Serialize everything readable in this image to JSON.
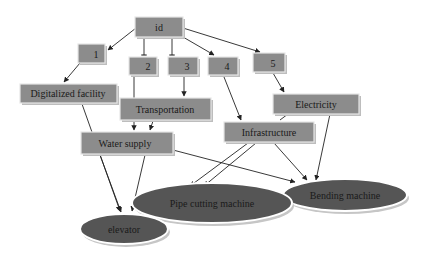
{
  "diagram": {
    "type": "directed-graph",
    "background": "#ffffff",
    "colors": {
      "rect_fill": "#8c8c8c",
      "ellipse_fill": "#555555",
      "edge": "#222222",
      "text": "#1a1a1a"
    },
    "nodes": [
      {
        "id": "id",
        "label": "id",
        "shape": "rect"
      },
      {
        "id": "n1",
        "label": "1",
        "shape": "rect"
      },
      {
        "id": "n2",
        "label": "2",
        "shape": "rect"
      },
      {
        "id": "n3",
        "label": "3",
        "shape": "rect"
      },
      {
        "id": "n4",
        "label": "4",
        "shape": "rect"
      },
      {
        "id": "n5",
        "label": "5",
        "shape": "rect"
      },
      {
        "id": "digitalized",
        "label": "Digitalized facility",
        "shape": "rect"
      },
      {
        "id": "transportation",
        "label": "Transportation",
        "shape": "rect"
      },
      {
        "id": "electricity",
        "label": "Electricity",
        "shape": "rect"
      },
      {
        "id": "infrastructure",
        "label": "Infrastructure",
        "shape": "rect"
      },
      {
        "id": "water",
        "label": "Water supply",
        "shape": "rect"
      },
      {
        "id": "pipe",
        "label": "Pipe cutting machine",
        "shape": "ellipse"
      },
      {
        "id": "bending",
        "label": "Bending machine",
        "shape": "ellipse"
      },
      {
        "id": "elevator",
        "label": "elevator",
        "shape": "ellipse"
      }
    ],
    "edges": [
      {
        "from": "id",
        "to": "n1"
      },
      {
        "from": "id",
        "to": "n2"
      },
      {
        "from": "id",
        "to": "n3"
      },
      {
        "from": "id",
        "to": "n4"
      },
      {
        "from": "id",
        "to": "n5"
      },
      {
        "from": "n1",
        "to": "digitalized"
      },
      {
        "from": "n2",
        "to": "water"
      },
      {
        "from": "n3",
        "to": "transportation"
      },
      {
        "from": "n4",
        "to": "infrastructure"
      },
      {
        "from": "n5",
        "to": "electricity"
      },
      {
        "from": "digitalized",
        "to": "elevator"
      },
      {
        "from": "transportation",
        "to": "water"
      },
      {
        "from": "electricity",
        "to": "infrastructure"
      },
      {
        "from": "electricity",
        "to": "bending"
      },
      {
        "from": "water",
        "to": "elevator"
      },
      {
        "from": "water",
        "to": "bending"
      },
      {
        "from": "infrastructure",
        "to": "pipe"
      },
      {
        "from": "infrastructure",
        "to": "pipe"
      },
      {
        "from": "infrastructure",
        "to": "bending"
      }
    ]
  }
}
